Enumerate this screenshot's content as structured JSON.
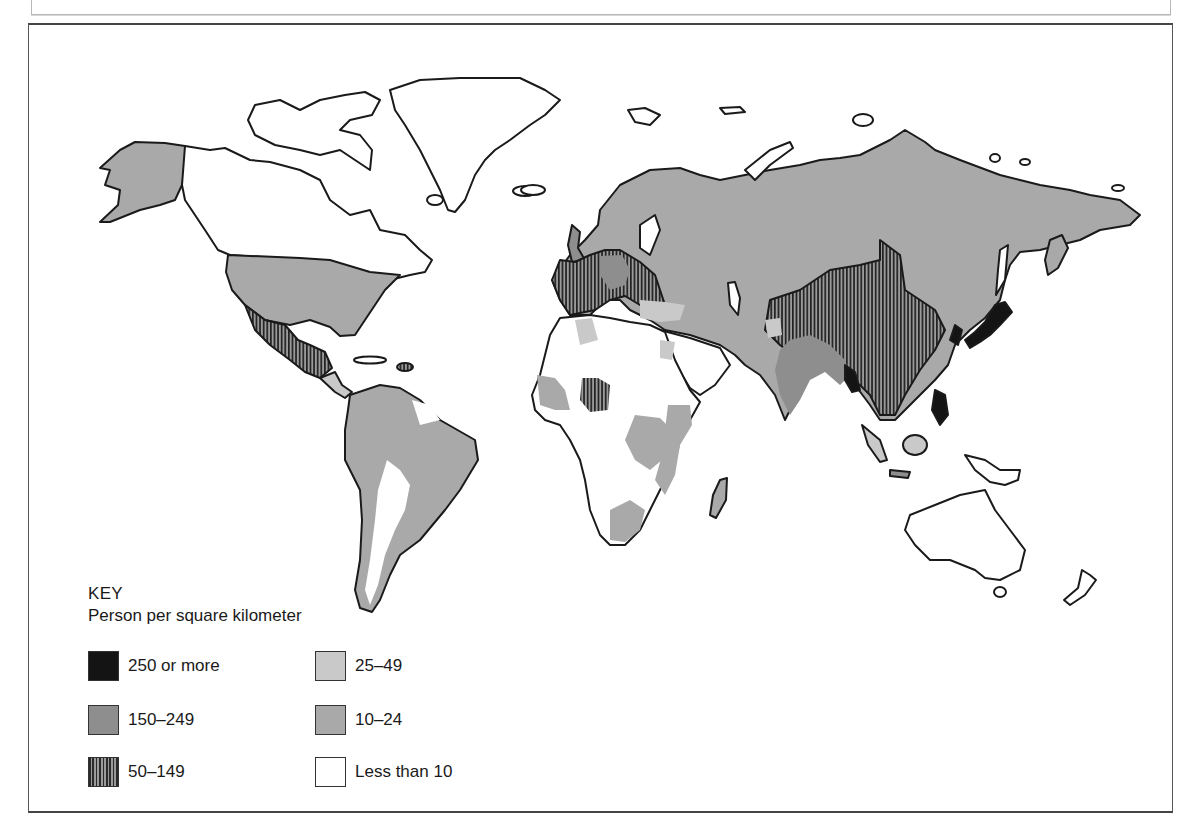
{
  "map": {
    "type": "choropleth",
    "subject": "World population density",
    "legend": {
      "title": "KEY",
      "subtitle": "Person per square kilometer",
      "items": [
        {
          "label": "250 or more",
          "pattern": "solid-black",
          "color": "#141414"
        },
        {
          "label": "150–249",
          "pattern": "dark-gray",
          "color": "#8e8e8e"
        },
        {
          "label": "50–149",
          "pattern": "vertical-hatch",
          "color": "#2a2a2a"
        },
        {
          "label": "25–49",
          "pattern": "light-gray",
          "color": "#c9c9c9"
        },
        {
          "label": "10–24",
          "pattern": "medium-gray",
          "color": "#a9a9a9"
        },
        {
          "label": "Less than 10",
          "pattern": "white",
          "color": "#ffffff"
        }
      ]
    },
    "colors": {
      "outline": "#1a1a1a",
      "fill_250_plus": "#141414",
      "fill_150_249": "#8e8e8e",
      "fill_50_149_hatch": "#2a2a2a",
      "fill_25_49": "#c9c9c9",
      "fill_10_24": "#a9a9a9",
      "fill_lt_10": "#ffffff"
    }
  }
}
